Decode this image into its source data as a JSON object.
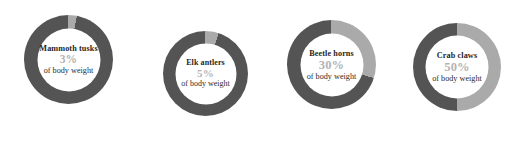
{
  "chart_data": {
    "type": "pie",
    "title": "",
    "subtitle": "",
    "xlabel": "",
    "ylabel": "",
    "legend_position": "none",
    "grid": false,
    "variant": "donut-gauge-row",
    "value_unit": "%",
    "value_range": [
      0,
      100
    ],
    "track_color": "#545454",
    "value_color": "#aaaaaa",
    "start_angle_deg": 0,
    "direction": "clockwise",
    "categories": [
      "Mammoth tusks",
      "Elk antlers",
      "Beetle horns",
      "Crab claws"
    ],
    "values": [
      3,
      5,
      30,
      50
    ],
    "series": [
      {
        "name": "Share of body weight",
        "values": [
          3,
          5,
          30,
          50
        ]
      }
    ],
    "annotations": [
      "of body weight",
      "of body weight",
      "of body weight",
      "of body weight"
    ]
  },
  "donuts": [
    {
      "id": "mammoth-tusks",
      "label": "Mammoth tusks",
      "percent_text": "3%",
      "value": 3,
      "sublabel": "of body weight"
    },
    {
      "id": "elk-antlers",
      "label": "Elk antlers",
      "percent_text": "5%",
      "value": 5,
      "sublabel": "of body weight"
    },
    {
      "id": "beetle-horns",
      "label": "Beetle horns",
      "percent_text": "30%",
      "value": 30,
      "sublabel": "of body weight"
    },
    {
      "id": "crab-claws",
      "label": "Crab claws",
      "percent_text": "50%",
      "value": 50,
      "sublabel": "of body weight"
    }
  ],
  "colors": {
    "track": "#545454",
    "value": "#aaaaaa",
    "label_text": "#262626",
    "percent_text": "#b3b3b3",
    "sublabel_text": "#2b2b2b",
    "background": "#ffffff"
  }
}
